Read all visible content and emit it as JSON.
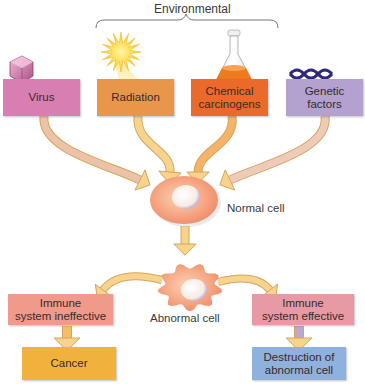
{
  "header": {
    "bracket_label": "Environmental"
  },
  "causes": [
    {
      "id": "virus",
      "label": "Virus",
      "color": "#d77fb3",
      "icon": "virus-icon"
    },
    {
      "id": "radiation",
      "label": "Radiation",
      "color": "#e8974a",
      "icon": "sun-icon"
    },
    {
      "id": "chemical",
      "label": "Chemical\ncarcinogens",
      "color": "#e96a2a",
      "icon": "flask-icon"
    },
    {
      "id": "genetic",
      "label": "Genetic\nfactors",
      "color": "#b3a1cf",
      "icon": "dna-icon"
    }
  ],
  "normal_cell": {
    "label": "Normal cell"
  },
  "abnormal_cell": {
    "label": "Abnormal cell"
  },
  "outcomes": {
    "ineffective": {
      "label": "Immune\nsystem ineffective",
      "color": "#f09a8c"
    },
    "effective": {
      "label": "Immune\nsystem effective",
      "color": "#e79aa6"
    },
    "cancer": {
      "label": "Cancer",
      "color": "#f0b23c"
    },
    "destruction": {
      "label": "Destruction of\nabnormal cell",
      "color": "#8fb1dd"
    }
  },
  "colors": {
    "arrow_fill": "#f7d48e",
    "arrow_stroke": "#d9a45a",
    "cell_body": "#f6a882",
    "nucleus": "#fbf3ec"
  }
}
